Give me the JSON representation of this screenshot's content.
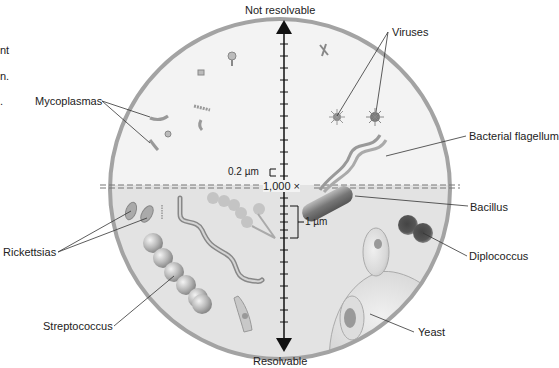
{
  "diagram": {
    "axis": {
      "top_label": "Not resolvable",
      "bottom_label": "Resolvable",
      "magnification_label": "1,000 ×",
      "scale_small": "0.2 µm",
      "scale_large": "1 µm"
    },
    "left_edge_fragments": [
      "nt",
      "n.",
      "."
    ],
    "labels": {
      "mycoplasmas": "Mycoplasmas",
      "viruses": "Viruses",
      "bacterial_flagellum": "Bacterial flagellum",
      "bacillus": "Bacillus",
      "diplococcus": "Diplococcus",
      "rickettsias": "Rickettsias",
      "streptococcus": "Streptococcus",
      "yeast": "Yeast"
    },
    "colors": {
      "upper_half": "#f3f3f3",
      "lower_half": "#e3e3e3",
      "border": "#a3a3a3",
      "axis": "#111111",
      "leader": "#333333"
    }
  }
}
